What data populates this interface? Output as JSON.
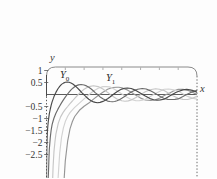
{
  "figure": {
    "frame_color": "#8a8a8a",
    "axis_color": "#4a4a4a",
    "tick_label_color": "#333333"
  },
  "chart_data": {
    "type": "line",
    "xlabel": "x",
    "ylabel": "y",
    "x_range": [
      0,
      16
    ],
    "y_range": [
      -3.479,
      1.146
    ],
    "x_ticks": [
      2,
      4,
      6,
      8,
      10,
      12,
      14
    ],
    "y_ticks": {
      "values": [
        1,
        0.5,
        -0.5,
        -1,
        -1.5,
        -2,
        -2.5
      ],
      "labels": [
        "1",
        "0.5",
        "−0.5",
        "−1",
        "−1.5",
        "−2",
        "−2.5"
      ]
    },
    "grid": false,
    "legend": "none",
    "annotations": [
      {
        "base": "Y",
        "sub": "0",
        "x": 2.18,
        "y": 0.73
      },
      {
        "base": "Y",
        "sub": "1",
        "x": 7.07,
        "y": 0.6
      }
    ],
    "series": [
      {
        "name": "Y0",
        "color": "#4a4a4a",
        "points": [
          [
            0.005,
            -3.48
          ],
          [
            0.02,
            -2.58
          ],
          [
            0.05,
            -1.98
          ],
          [
            0.1,
            -1.534
          ],
          [
            0.15,
            -1.28
          ],
          [
            0.2,
            -1.081
          ],
          [
            0.3,
            -0.807
          ],
          [
            0.4,
            -0.606
          ],
          [
            0.5,
            -0.445
          ],
          [
            0.6,
            -0.309
          ],
          [
            0.7,
            -0.191
          ],
          [
            0.8,
            -0.087
          ],
          [
            0.893,
            0
          ],
          [
            1.0,
            0.088
          ],
          [
            1.2,
            0.228
          ],
          [
            1.4,
            0.338
          ],
          [
            1.6,
            0.42
          ],
          [
            1.8,
            0.477
          ],
          [
            2.0,
            0.51
          ],
          [
            2.2,
            0.521
          ],
          [
            2.4,
            0.51
          ],
          [
            2.6,
            0.481
          ],
          [
            2.8,
            0.436
          ],
          [
            3.0,
            0.377
          ],
          [
            3.25,
            0.285
          ],
          [
            3.5,
            0.189
          ],
          [
            3.75,
            0.08
          ],
          [
            3.958,
            0
          ],
          [
            4.0,
            -0.017
          ],
          [
            4.25,
            -0.112
          ],
          [
            4.5,
            -0.195
          ],
          [
            4.75,
            -0.258
          ],
          [
            5.0,
            -0.309
          ],
          [
            5.2,
            -0.331
          ],
          [
            5.43,
            -0.34
          ],
          [
            5.7,
            -0.327
          ],
          [
            6.0,
            -0.288
          ],
          [
            6.25,
            -0.237
          ],
          [
            6.5,
            -0.173
          ],
          [
            6.75,
            -0.103
          ],
          [
            7.086,
            0
          ],
          [
            7.3,
            0.061
          ],
          [
            7.5,
            0.117
          ],
          [
            7.75,
            0.175
          ],
          [
            8.0,
            0.224
          ],
          [
            8.3,
            0.26
          ],
          [
            8.6,
            0.273
          ],
          [
            9.0,
            0.25
          ],
          [
            9.5,
            0.171
          ],
          [
            10.0,
            0.056
          ],
          [
            10.22,
            0
          ],
          [
            10.5,
            -0.068
          ],
          [
            11.0,
            -0.169
          ],
          [
            11.4,
            -0.219
          ],
          [
            11.75,
            -0.232
          ],
          [
            12.1,
            -0.225
          ],
          [
            12.5,
            -0.194
          ],
          [
            13.0,
            -0.078
          ],
          [
            13.36,
            0
          ],
          [
            13.75,
            0.084
          ],
          [
            14.0,
            0.127
          ],
          [
            14.5,
            0.191
          ],
          [
            14.9,
            0.212
          ],
          [
            15.25,
            0.193
          ],
          [
            15.5,
            0.17
          ],
          [
            16.0,
            0.095
          ]
        ]
      },
      {
        "name": "Y1",
        "color": "#6b6b6b",
        "points": [
          [
            0.183,
            -3.48
          ],
          [
            0.2,
            -3.324
          ],
          [
            0.25,
            -2.704
          ],
          [
            0.3,
            -2.293
          ],
          [
            0.4,
            -1.781
          ],
          [
            0.5,
            -1.471
          ],
          [
            0.6,
            -1.26
          ],
          [
            0.7,
            -1.103
          ],
          [
            0.8,
            -0.978
          ],
          [
            0.9,
            -0.873
          ],
          [
            1.0,
            -0.781
          ],
          [
            1.2,
            -0.621
          ],
          [
            1.4,
            -0.479
          ],
          [
            1.6,
            -0.348
          ],
          [
            1.8,
            -0.224
          ],
          [
            2.0,
            -0.107
          ],
          [
            2.197,
            0
          ],
          [
            2.4,
            0.1
          ],
          [
            2.6,
            0.19
          ],
          [
            2.8,
            0.264
          ],
          [
            3.0,
            0.325
          ],
          [
            3.2,
            0.371
          ],
          [
            3.4,
            0.401
          ],
          [
            3.68,
            0.417
          ],
          [
            4.0,
            0.398
          ],
          [
            4.25,
            0.358
          ],
          [
            4.5,
            0.301
          ],
          [
            4.75,
            0.228
          ],
          [
            5.0,
            0.148
          ],
          [
            5.2,
            0.066
          ],
          [
            5.43,
            0
          ],
          [
            5.7,
            -0.1
          ],
          [
            6.0,
            -0.175
          ],
          [
            6.25,
            -0.229
          ],
          [
            6.5,
            -0.274
          ],
          [
            6.75,
            -0.293
          ],
          [
            7.0,
            -0.303
          ],
          [
            7.25,
            -0.291
          ],
          [
            7.5,
            -0.259
          ],
          [
            7.75,
            -0.215
          ],
          [
            8.0,
            -0.158
          ],
          [
            8.3,
            -0.077
          ],
          [
            8.596,
            0
          ],
          [
            9.0,
            0.104
          ],
          [
            9.35,
            0.167
          ],
          [
            9.7,
            0.22
          ],
          [
            10.17,
            0.249
          ],
          [
            10.6,
            0.23
          ],
          [
            11.0,
            0.164
          ],
          [
            11.4,
            0.08
          ],
          [
            11.749,
            0
          ],
          [
            12.1,
            -0.083
          ],
          [
            12.5,
            -0.165
          ],
          [
            12.9,
            -0.204
          ],
          [
            13.3,
            -0.21
          ],
          [
            13.65,
            -0.203
          ],
          [
            14.0,
            -0.185
          ],
          [
            14.5,
            -0.085
          ],
          [
            14.897,
            0
          ],
          [
            15.25,
            0.066
          ],
          [
            15.5,
            0.111
          ],
          [
            16.0,
            0.176
          ]
        ]
      },
      {
        "name": "Y2",
        "color": "#c6c6c6",
        "points": [
          [
            0.66,
            -3.48
          ],
          [
            0.7,
            -3.0
          ],
          [
            0.8,
            -2.358
          ],
          [
            0.9,
            -1.947
          ],
          [
            1.0,
            -1.651
          ],
          [
            1.25,
            -1.192
          ],
          [
            1.5,
            -0.932
          ],
          [
            1.75,
            -0.754
          ],
          [
            2.0,
            -0.617
          ],
          [
            2.25,
            -0.498
          ],
          [
            2.5,
            -0.381
          ],
          [
            2.75,
            -0.271
          ],
          [
            3.0,
            -0.16
          ],
          [
            3.384,
            0
          ],
          [
            3.75,
            0.142
          ],
          [
            4.0,
            0.216
          ],
          [
            4.5,
            0.329
          ],
          [
            5.0,
            0.367
          ],
          [
            5.5,
            0.33
          ],
          [
            6.0,
            0.23
          ],
          [
            6.5,
            0.089
          ],
          [
            6.794,
            0
          ],
          [
            7.0,
            -0.061
          ],
          [
            7.5,
            -0.186
          ],
          [
            8.0,
            -0.263
          ],
          [
            8.35,
            -0.279
          ],
          [
            8.7,
            -0.266
          ],
          [
            9.0,
            -0.227
          ],
          [
            9.5,
            -0.128
          ],
          [
            10.023,
            0
          ],
          [
            10.5,
            0.114
          ],
          [
            11.0,
            0.199
          ],
          [
            11.6,
            0.24
          ],
          [
            12.0,
            0.216
          ],
          [
            12.5,
            0.168
          ],
          [
            13.21,
            0
          ],
          [
            13.5,
            -0.061
          ],
          [
            14.0,
            -0.153
          ],
          [
            14.5,
            -0.203
          ],
          [
            15.0,
            -0.208
          ],
          [
            15.5,
            -0.156
          ],
          [
            16.0,
            -0.073
          ]
        ]
      },
      {
        "name": "Y3",
        "color": "#d2d2d2",
        "points": [
          [
            1.23,
            -3.48
          ],
          [
            1.4,
            -2.44
          ],
          [
            1.6,
            -1.79
          ],
          [
            1.8,
            -1.389
          ],
          [
            2.0,
            -1.128
          ],
          [
            2.25,
            -0.91
          ],
          [
            2.5,
            -0.756
          ],
          [
            2.75,
            -0.639
          ],
          [
            3.0,
            -0.538
          ],
          [
            3.5,
            -0.359
          ],
          [
            4.0,
            -0.182
          ],
          [
            4.527,
            0
          ],
          [
            5.0,
            0.146
          ],
          [
            5.5,
            0.264
          ],
          [
            6.0,
            0.328
          ],
          [
            6.35,
            0.331
          ],
          [
            6.7,
            0.318
          ],
          [
            7.0,
            0.268
          ],
          [
            7.5,
            0.16
          ],
          [
            8.097,
            0
          ],
          [
            8.5,
            -0.104
          ],
          [
            9.0,
            -0.205
          ],
          [
            9.5,
            -0.257
          ],
          [
            9.84,
            -0.263
          ],
          [
            10.2,
            -0.233
          ],
          [
            10.5,
            -0.197
          ],
          [
            11.0,
            -0.092
          ],
          [
            11.396,
            0
          ],
          [
            12.0,
            0.127
          ],
          [
            12.5,
            0.219
          ],
          [
            13.0,
            0.23
          ],
          [
            13.5,
            0.19
          ],
          [
            14.0,
            0.141
          ],
          [
            14.623,
            0
          ],
          [
            15.0,
            -0.077
          ],
          [
            15.5,
            -0.151
          ],
          [
            16.0,
            -0.194
          ]
        ]
      },
      {
        "name": "Y4",
        "color": "#969696",
        "points": [
          [
            1.88,
            -3.48
          ],
          [
            2.0,
            -2.767
          ],
          [
            2.25,
            -1.93
          ],
          [
            2.5,
            -1.433
          ],
          [
            2.75,
            -1.123
          ],
          [
            3.0,
            -0.916
          ],
          [
            3.5,
            -0.66
          ],
          [
            4.0,
            -0.489
          ],
          [
            4.5,
            -0.36
          ],
          [
            5.0,
            -0.193
          ],
          [
            5.5,
            -0.042
          ],
          [
            5.645,
            0
          ],
          [
            6.0,
            0.098
          ],
          [
            6.5,
            0.215
          ],
          [
            7.0,
            0.291
          ],
          [
            7.5,
            0.305
          ],
          [
            7.7,
            0.306
          ],
          [
            8.0,
            0.283
          ],
          [
            8.5,
            0.203
          ],
          [
            9.0,
            0.09
          ],
          [
            9.362,
            0
          ],
          [
            9.7,
            -0.072
          ],
          [
            10.0,
            -0.149
          ],
          [
            10.5,
            -0.227
          ],
          [
            11.1,
            -0.25
          ],
          [
            11.5,
            -0.228
          ],
          [
            12.0,
            -0.153
          ],
          [
            12.73,
            0
          ],
          [
            13.0,
            0.042
          ],
          [
            13.5,
            0.145
          ],
          [
            14.0,
            0.213
          ],
          [
            14.3,
            0.218
          ],
          [
            14.5,
            0.215
          ],
          [
            15.0,
            0.177
          ],
          [
            15.5,
            0.098
          ],
          [
            16.0,
            0.0
          ]
        ]
      }
    ]
  }
}
